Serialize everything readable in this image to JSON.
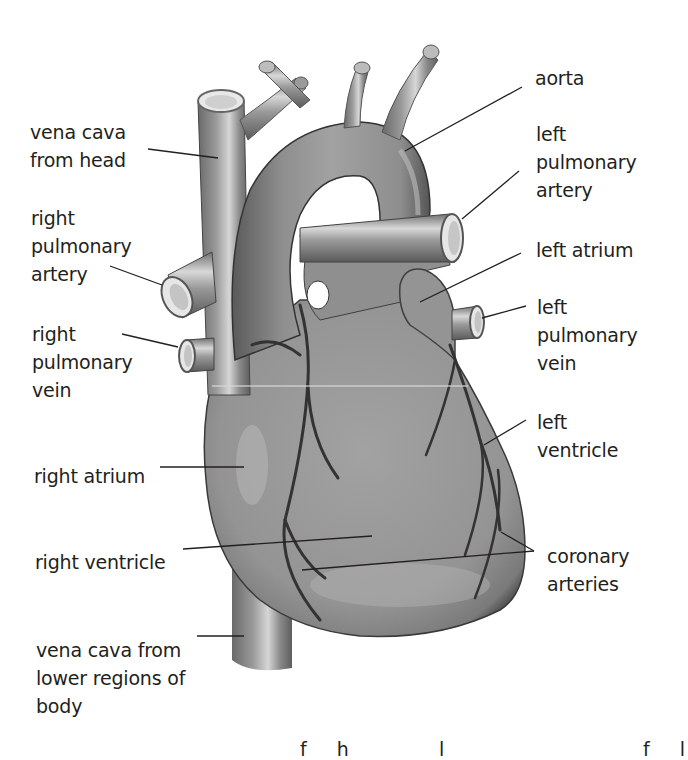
{
  "diagram": {
    "colors": {
      "background": "#ffffff",
      "text": "#231f20",
      "heart_fill": "#8e8e8e",
      "heart_shadow": "#5a5a5a",
      "highlight": "#c9c9c9",
      "leader_line": "#231f20",
      "coronary": "#3a3a3a"
    },
    "labels_left": [
      {
        "id": "vena-cava-head",
        "text": "vena cava\nfrom head"
      },
      {
        "id": "right-pulmonary-artery",
        "text": "right\npulmonary\nartery"
      },
      {
        "id": "right-pulmonary-vein",
        "text": "right\npulmonary\nvein"
      },
      {
        "id": "right-atrium",
        "text": "right atrium"
      },
      {
        "id": "right-ventricle",
        "text": "right ventricle"
      },
      {
        "id": "vena-cava-lower",
        "text": "vena cava from\nlower regions of\nbody"
      }
    ],
    "labels_right": [
      {
        "id": "aorta",
        "text": "aorta"
      },
      {
        "id": "left-pulmonary-artery",
        "text": "left\npulmonary\nartery"
      },
      {
        "id": "left-atrium",
        "text": "left atrium"
      },
      {
        "id": "left-pulmonary-vein",
        "text": "left\npulmonary\nvein"
      },
      {
        "id": "left-ventricle",
        "text": "left\nventricle"
      },
      {
        "id": "coronary-arteries",
        "text": "coronary\narteries"
      }
    ],
    "footer_partial_text": "f  h       l                f  l"
  }
}
